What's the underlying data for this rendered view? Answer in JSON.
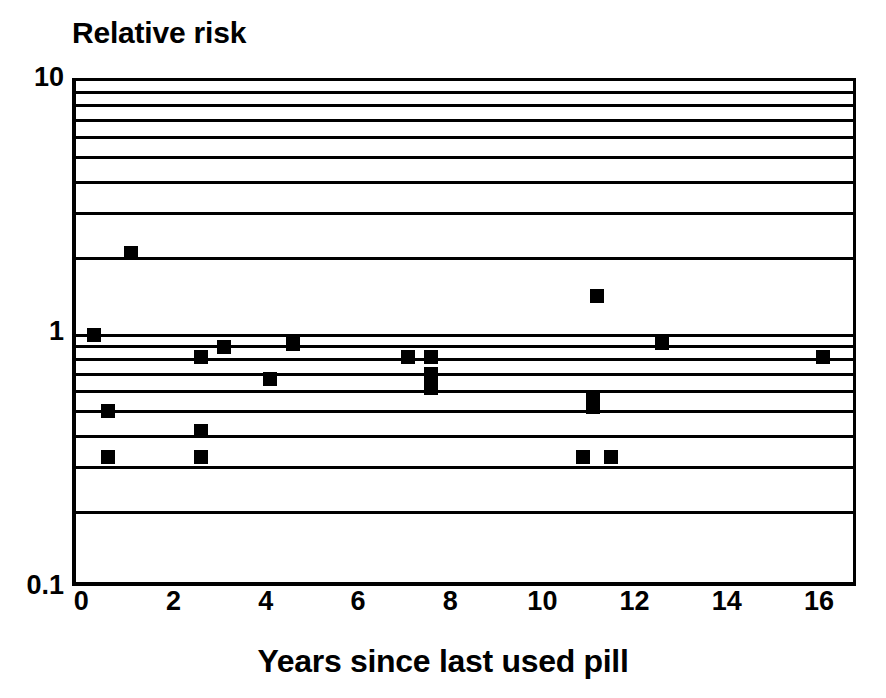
{
  "chart_data": {
    "type": "scatter",
    "title": "Relative risk",
    "xlabel": "Years since last used pill",
    "ylabel": "Relative risk",
    "yscale": "log",
    "ylim": [
      0.1,
      10
    ],
    "xlim": [
      -0.2,
      16.8
    ],
    "grid": true,
    "legend": "none",
    "ytick_labels": [
      "10",
      "1",
      "0.1"
    ],
    "ytick_values": [
      10,
      1,
      0.1
    ],
    "xtick_labels": [
      "0",
      "2",
      "4",
      "6",
      "8",
      "10",
      "12",
      "14",
      "16"
    ],
    "xtick_values": [
      0,
      2,
      4,
      6,
      8,
      10,
      12,
      14,
      16
    ],
    "minor_gridline_values": [
      9,
      8,
      7,
      6,
      5,
      4,
      3,
      2,
      0.9,
      0.8,
      0.7,
      0.6,
      0.5,
      0.4,
      0.3,
      0.2
    ],
    "marker_style": "filled-square",
    "marker_color": "#000000",
    "points": [
      {
        "x": 0.2,
        "y": 1.0
      },
      {
        "x": 1.0,
        "y": 2.1
      },
      {
        "x": 0.5,
        "y": 0.5
      },
      {
        "x": 0.5,
        "y": 0.33
      },
      {
        "x": 2.5,
        "y": 0.82
      },
      {
        "x": 2.5,
        "y": 0.42
      },
      {
        "x": 2.5,
        "y": 0.33
      },
      {
        "x": 3.0,
        "y": 0.9
      },
      {
        "x": 4.0,
        "y": 0.67
      },
      {
        "x": 4.5,
        "y": 0.92
      },
      {
        "x": 7.0,
        "y": 0.82
      },
      {
        "x": 7.5,
        "y": 0.82
      },
      {
        "x": 7.5,
        "y": 0.7
      },
      {
        "x": 7.5,
        "y": 0.62
      },
      {
        "x": 11.1,
        "y": 1.42
      },
      {
        "x": 11.0,
        "y": 0.57
      },
      {
        "x": 11.0,
        "y": 0.52
      },
      {
        "x": 10.8,
        "y": 0.33
      },
      {
        "x": 11.4,
        "y": 0.33
      },
      {
        "x": 12.5,
        "y": 0.93
      },
      {
        "x": 16.0,
        "y": 0.82
      }
    ]
  }
}
